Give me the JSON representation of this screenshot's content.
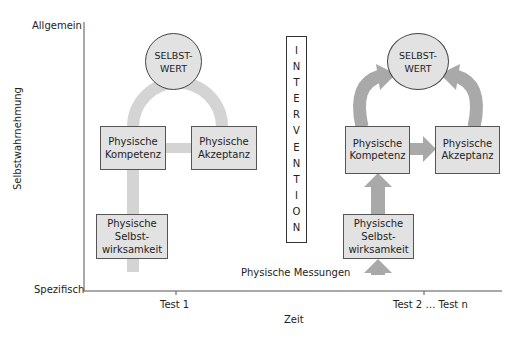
{
  "axes": {
    "y_label": "Selbstwahrnehmung",
    "y_top": "Allgemein",
    "y_bottom": "Spezifisch",
    "x_label": "Zeit",
    "x_ticks": [
      "Test 1",
      "Test 2 … Test n"
    ]
  },
  "left_model": {
    "self_worth": [
      "SELBST-",
      "WERT"
    ],
    "competence": [
      "Physische",
      "Kompetenz"
    ],
    "acceptance": [
      "Physische",
      "Akzeptanz"
    ],
    "self_efficacy": [
      "Physische",
      "Selbst-",
      "wirksamkeit"
    ]
  },
  "intervention": {
    "letters": [
      "I",
      "N",
      "T",
      "E",
      "R",
      "V",
      "E",
      "N",
      "T",
      "I",
      "O",
      "N"
    ]
  },
  "right_model": {
    "self_worth": [
      "SELBST-",
      "WERT"
    ],
    "competence": [
      "Physische",
      "Kompetenz"
    ],
    "acceptance": [
      "Physische",
      "Akzeptanz"
    ],
    "self_efficacy": [
      "Physische",
      "Selbst-",
      "wirksamkeit"
    ],
    "change_symbol": "△"
  },
  "measurements_label": "Physische Messungen",
  "colors": {
    "box_fill": "#e2e2e2",
    "left_connector": "#d4d4d4",
    "right_arrow": "#a9a9a9",
    "axis": "#555555"
  }
}
